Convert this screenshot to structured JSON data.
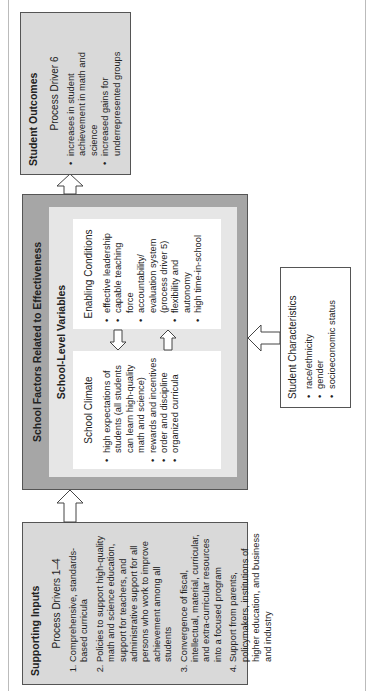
{
  "supporting_inputs": {
    "title": "Supporting Inputs",
    "subtitle": "Process Drivers 1–4",
    "items": [
      "Comprehensive, standards-based curricula",
      "Policies to support high-quality math and science education, support for teachers, and administrative support for all persons who work to improve achievement among all students",
      "Convergence of fiscal, intellectual, material, curricular, and extra-curricular resources into a focused program",
      "Support from parents, policymakers, institutions of higher education, and business and industry"
    ]
  },
  "school_factors": {
    "title": "School Factors Related to Effectiveness",
    "subtitle": "School-Level Variables",
    "climate": {
      "title": "School Climate",
      "items": [
        "high expectations of students (all students can learn high-quality math and science)",
        "rewards and incentives",
        "order and discipline",
        "organized curricula"
      ]
    },
    "enabling": {
      "title": "Enabling Conditions",
      "items": [
        "effective leadership",
        "capable teaching force",
        "accountability/ evaluation system (process driver 5)",
        "flexibility and autonomy",
        "high time-in-school"
      ]
    }
  },
  "student_characteristics": {
    "title": "Student Characteristics",
    "items": [
      "race/ethnicity",
      "gender",
      "socioeconomic status"
    ]
  },
  "student_outcomes": {
    "title": "Student Outcomes",
    "subtitle": "Process Driver 6",
    "items": [
      "increases in student achievement in math and science",
      "increased gains for underrepresented groups"
    ]
  },
  "colors": {
    "box_fill": "#d9d9d9",
    "outer_fill": "#a6a6a6",
    "inner_fill": "#e6e6e6"
  }
}
